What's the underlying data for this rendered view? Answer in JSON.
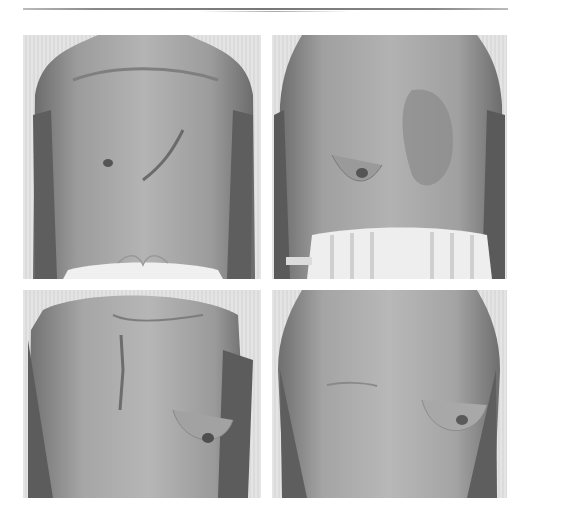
{
  "page": {
    "header_text": "",
    "header_legible": false
  },
  "figures": [
    {
      "id": "photo-top-left",
      "description": "Frontal torso photograph, post-operative chest with diagonal scar on left side, white drawstring trousers"
    },
    {
      "id": "photo-top-right",
      "description": "Frontal torso photograph, chest with scarred/grafted area on left side, hospital wristband on right wrist, striped trousers"
    },
    {
      "id": "photo-bottom-left",
      "description": "Oblique torso photograph, chest with vertical scar on right side"
    },
    {
      "id": "photo-bottom-right",
      "description": "Frontal torso photograph, chest with faint horizontal scar on right side"
    }
  ],
  "colors": {
    "background": "#ffffff",
    "photo_bg": "#e0e0e0",
    "skin_dark": "#6e6e6e",
    "skin_mid": "#9a9a9a",
    "skin_light": "#b8b8b8"
  }
}
